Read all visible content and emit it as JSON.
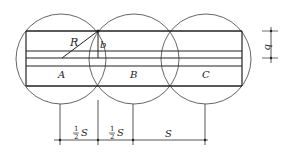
{
  "diagram": {
    "circles": [
      {
        "id": "A",
        "cx": 61,
        "cy": 59,
        "r": 45,
        "label": "A"
      },
      {
        "id": "B",
        "cx": 134,
        "cy": 59,
        "r": 45,
        "label": "B"
      },
      {
        "id": "C",
        "cx": 206,
        "cy": 59,
        "r": 45,
        "label": "C"
      }
    ],
    "labels": {
      "radius": "R",
      "width_inner": "b",
      "width_dim": "b",
      "half_s_num": "1",
      "half_s_den": "2",
      "s": "S",
      "spacing_1": "S",
      "spacing_2": "S",
      "spacing_3": "S"
    },
    "colors": {
      "stroke": "#333333",
      "circle_stroke": "#555555",
      "background": "#ffffff"
    }
  }
}
